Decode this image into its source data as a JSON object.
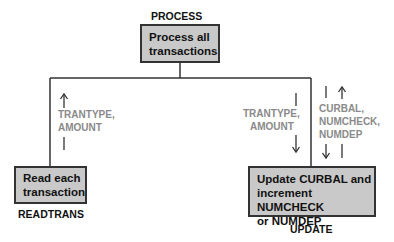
{
  "modules": {
    "process": {
      "title": "PROCESS",
      "text_line1": "Process all",
      "text_line2": "transactions"
    },
    "readtrans": {
      "title": "READTRANS",
      "text_line1": "Read each",
      "text_line2": "transaction"
    },
    "update": {
      "title": "UPDATE",
      "text_line1": "Update CURBAL and",
      "text_line2": "increment NUMCHECK",
      "text_line3": "or NUMDEP"
    }
  },
  "flows": {
    "readtrans_up": {
      "direction": "up",
      "line1": "TRANTYPE,",
      "line2": "AMOUNT"
    },
    "update_down": {
      "direction": "down",
      "line1": "TRANTYPE,",
      "line2": "AMOUNT"
    },
    "update_up": {
      "direction": "up",
      "line1": "CURBAL,",
      "line2": "NUMCHECK,",
      "line3": "NUMDEP"
    }
  },
  "colors": {
    "box_fill": "#c9c9c9",
    "line": "#333333",
    "flow_text": "#8a8a8a"
  }
}
